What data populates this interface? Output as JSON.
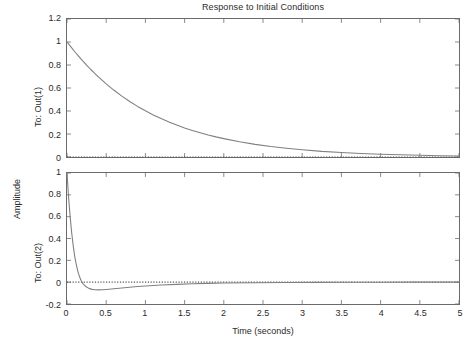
{
  "figure": {
    "title": "Response to Initial Conditions",
    "xlabel": "Time (seconds)",
    "ylabel": "Amplitude",
    "background": "#ffffff",
    "axis_color": "#6b6b6b",
    "curve_color": "#808080",
    "zero_line_color": "#555555"
  },
  "chart_data": [
    {
      "type": "line",
      "id": "subplot-top",
      "title": "Response to Initial Conditions",
      "xlabel": "",
      "ylabel": "To: Out(1)",
      "xlim": [
        0,
        5
      ],
      "ylim": [
        0,
        1.2
      ],
      "xticks": [
        0,
        0.5,
        1,
        1.5,
        2,
        2.5,
        3,
        3.5,
        4,
        4.5,
        5
      ],
      "xticklabels": [
        "0",
        "0.5",
        "1",
        "1.5",
        "2",
        "2.5",
        "3",
        "3.5",
        "4",
        "4.5",
        "5"
      ],
      "yticks": [
        0,
        0.2,
        0.4,
        0.6,
        0.8,
        1,
        1.2
      ],
      "yticklabels": [
        "0",
        "0.2",
        "0.4",
        "0.6",
        "0.8",
        "1",
        "1.2"
      ],
      "grid": false,
      "legend": null,
      "zero_line": true,
      "series": [
        {
          "name": "To: Out(1)",
          "color": "#808080",
          "x": [
            0,
            0.05,
            0.1,
            0.15,
            0.2,
            0.25,
            0.3,
            0.35,
            0.4,
            0.45,
            0.5,
            0.6,
            0.7,
            0.8,
            0.9,
            1.0,
            1.1,
            1.2,
            1.3,
            1.4,
            1.5,
            1.6,
            1.7,
            1.8,
            1.9,
            2.0,
            2.2,
            2.4,
            2.6,
            2.8,
            3.0,
            3.25,
            3.5,
            3.75,
            4.0,
            4.25,
            4.5,
            4.75,
            5.0
          ],
          "y": [
            1.0,
            0.957,
            0.915,
            0.875,
            0.836,
            0.799,
            0.763,
            0.729,
            0.697,
            0.666,
            0.636,
            0.58,
            0.529,
            0.483,
            0.44,
            0.402,
            0.366,
            0.334,
            0.305,
            0.278,
            0.253,
            0.231,
            0.211,
            0.192,
            0.175,
            0.16,
            0.133,
            0.11,
            0.091,
            0.076,
            0.063,
            0.049,
            0.039,
            0.03,
            0.024,
            0.019,
            0.015,
            0.011,
            0.009
          ]
        }
      ]
    },
    {
      "type": "line",
      "id": "subplot-bottom",
      "title": "",
      "xlabel": "Time (seconds)",
      "ylabel": "To: Out(2)",
      "xlim": [
        0,
        5
      ],
      "ylim": [
        -0.2,
        1.0
      ],
      "xticks": [
        0,
        0.5,
        1,
        1.5,
        2,
        2.5,
        3,
        3.5,
        4,
        4.5,
        5
      ],
      "xticklabels": [
        "0",
        "0.5",
        "1",
        "1.5",
        "2",
        "2.5",
        "3",
        "3.5",
        "4",
        "4.5",
        "5"
      ],
      "yticks": [
        -0.2,
        0,
        0.2,
        0.4,
        0.6,
        0.8,
        1
      ],
      "yticklabels": [
        "-0.2",
        "0",
        "0.2",
        "0.4",
        "0.6",
        "0.8",
        "1"
      ],
      "grid": false,
      "legend": null,
      "zero_line": true,
      "series": [
        {
          "name": "To: Out(2)",
          "color": "#808080",
          "x": [
            0,
            0.02,
            0.04,
            0.06,
            0.08,
            0.1,
            0.12,
            0.14,
            0.16,
            0.18,
            0.2,
            0.24,
            0.28,
            0.32,
            0.36,
            0.4,
            0.45,
            0.5,
            0.6,
            0.7,
            0.8,
            0.9,
            1.0,
            1.2,
            1.4,
            1.6,
            1.8,
            2.0,
            2.4,
            2.8,
            3.2,
            3.6,
            4.0,
            4.4,
            5.0
          ],
          "y": [
            1.0,
            0.78,
            0.6,
            0.45,
            0.33,
            0.23,
            0.155,
            0.095,
            0.05,
            0.016,
            -0.01,
            -0.04,
            -0.057,
            -0.066,
            -0.07,
            -0.071,
            -0.07,
            -0.067,
            -0.06,
            -0.053,
            -0.046,
            -0.04,
            -0.035,
            -0.026,
            -0.02,
            -0.015,
            -0.011,
            -0.008,
            -0.005,
            -0.003,
            -0.002,
            -0.001,
            -0.001,
            0.0,
            0.0
          ]
        }
      ]
    }
  ]
}
